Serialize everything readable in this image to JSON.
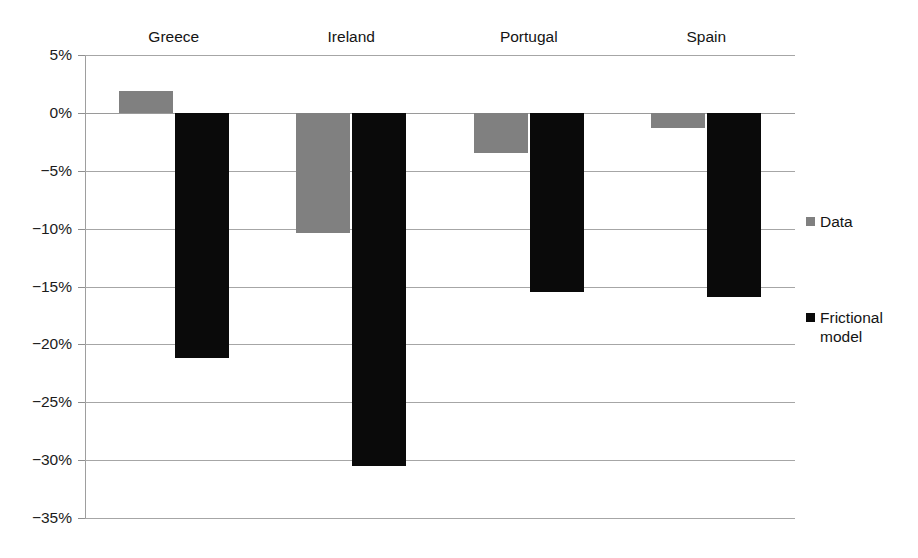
{
  "chart_data": {
    "type": "bar",
    "title": "",
    "subtitle": "",
    "xlabel": "",
    "ylabel": "",
    "categories": [
      "Greece",
      "Ireland",
      "Portugal",
      "Spain"
    ],
    "series": [
      {
        "name": "Data",
        "color": "#808080",
        "values": [
          1.9,
          -10.4,
          -3.5,
          -1.3
        ]
      },
      {
        "name": "Frictional model",
        "color": "#0a0a0a",
        "values": [
          -21.2,
          -30.5,
          -15.5,
          -15.9
        ]
      }
    ],
    "ylim": [
      -35,
      5
    ],
    "ytick_values": [
      5,
      0,
      -5,
      -10,
      -15,
      -20,
      -25,
      -30,
      -35
    ],
    "ytick_labels": [
      "5%",
      "0%",
      "−5%",
      "−10%",
      "−15%",
      "−20%",
      "−25%",
      "−30%",
      "−35%"
    ],
    "value_unit": "%",
    "grid": true,
    "grid_axis": "y",
    "legend_position": "right",
    "category_labels_position": "top",
    "legend_entries": [
      "Data",
      "Frictional model"
    ]
  }
}
